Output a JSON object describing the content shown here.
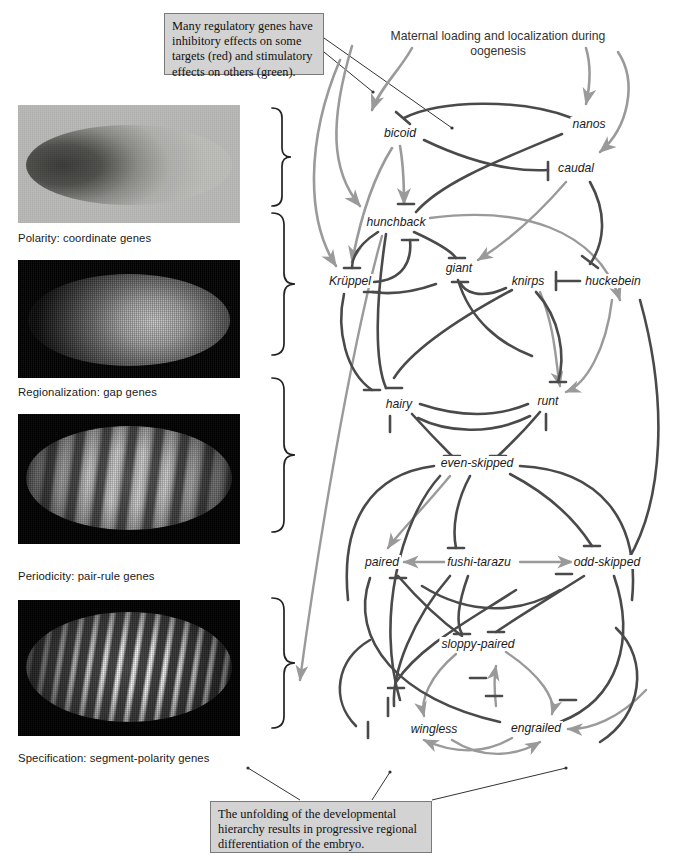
{
  "figure": {
    "header": "Maternal loading and localization during oogenesis",
    "callout_top": "Many regulatory genes have inhibitory effects on some targets (red) and stimulatory effects on others (green).",
    "callout_bottom": "The unfolding of the developmental hierarchy results in progressive regional differentiation of the embryo."
  },
  "colors": {
    "inhibitory": "#4a4a4a",
    "stimulatory": "#9a9a9a",
    "callout_bg": "#d3d3d3",
    "callout_border": "#7a7a7a",
    "embryo_dark_bg": "#000000",
    "embryo_light_bg": "#b9b9b7"
  },
  "panels": [
    {
      "caption": "Polarity: coordinate genes",
      "kind": "gradient-embryo",
      "stripes": 0
    },
    {
      "caption": "Regionalization: gap genes",
      "kind": "broad-domain",
      "stripes": 0
    },
    {
      "caption": "Periodicity: pair-rule genes",
      "kind": "striped-embryo",
      "stripes": 7
    },
    {
      "caption": "Specification: segment-polarity genes",
      "kind": "striped-embryo",
      "stripes": 14
    }
  ],
  "genes": [
    {
      "id": "bicoid",
      "label": "bicoid",
      "x": 400,
      "y": 133
    },
    {
      "id": "nanos",
      "label": "nanos",
      "x": 589,
      "y": 124
    },
    {
      "id": "caudal",
      "label": "caudal",
      "x": 576,
      "y": 168
    },
    {
      "id": "hunchback",
      "label": "hunchback",
      "x": 396,
      "y": 222
    },
    {
      "id": "kruppel",
      "label": "Krüppel",
      "x": 350,
      "y": 281
    },
    {
      "id": "giant",
      "label": "giant",
      "x": 459,
      "y": 268
    },
    {
      "id": "knirps",
      "label": "knirps",
      "x": 528,
      "y": 281
    },
    {
      "id": "huckebein",
      "label": "huckebein",
      "x": 613,
      "y": 281
    },
    {
      "id": "hairy",
      "label": "hairy",
      "x": 399,
      "y": 404
    },
    {
      "id": "runt",
      "label": "runt",
      "x": 548,
      "y": 401
    },
    {
      "id": "even-skipped",
      "label": "even-skipped",
      "x": 477,
      "y": 463
    },
    {
      "id": "paired",
      "label": "paired",
      "x": 382,
      "y": 562
    },
    {
      "id": "fushi-tarazu",
      "label": "fushi-tarazu",
      "x": 479,
      "y": 562
    },
    {
      "id": "odd-skipped",
      "label": "odd-skipped",
      "x": 607,
      "y": 562
    },
    {
      "id": "sloppy-paired",
      "label": "sloppy-paired",
      "x": 478,
      "y": 644
    },
    {
      "id": "wingless",
      "label": "wingless",
      "x": 434,
      "y": 729
    },
    {
      "id": "engrailed",
      "label": "engrailed",
      "x": 536,
      "y": 728
    }
  ]
}
